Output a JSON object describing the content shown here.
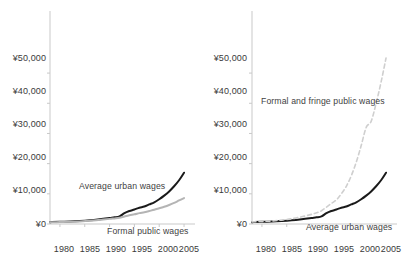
{
  "figure": {
    "background_color": "#ffffff",
    "panel_count": 2
  },
  "axis": {
    "axis_color": "#c9c9c9",
    "y_ticks": [
      "¥0",
      "¥10,000",
      "¥20,000",
      "¥30,000",
      "¥40,000",
      "¥50,000"
    ],
    "x_ticks": [
      "1980",
      "1985",
      "1990",
      "1995",
      "2000",
      "2005"
    ]
  },
  "labels": {
    "left_average_urban": "Average urban wages",
    "left_formal_public": "Formal public wages",
    "right_formal_fringe": "Formal and fringe public wages",
    "right_average_urban": "Average urban wages"
  },
  "colors": {
    "average_urban_wages": "#1a1a1a",
    "formal_public_wages": "#b4b4b4",
    "formal_and_fringe_public_wages": "#cfcfcf",
    "axis": "#c9c9c9",
    "text": "#3a3a3a"
  },
  "chart_data": [
    {
      "type": "line",
      "panel": "left",
      "title": "",
      "xlabel": "",
      "ylabel": "",
      "xlim": [
        1978,
        2006
      ],
      "ylim": [
        0,
        55000
      ],
      "ytick_values": [
        0,
        10000,
        20000,
        30000,
        40000,
        50000
      ],
      "ytick_labels": [
        "¥0",
        "¥10,000",
        "¥20,000",
        "¥30,000",
        "¥40,000",
        "¥50,000"
      ],
      "xtick_values": [
        1980,
        1985,
        1990,
        1995,
        2000,
        2005
      ],
      "xtick_labels": [
        "1980",
        "1985",
        "1990",
        "1995",
        "2000",
        "2005"
      ],
      "grid": false,
      "legend": "inline-annotations",
      "x": [
        1978,
        1980,
        1982,
        1984,
        1986,
        1988,
        1990,
        1991,
        1992,
        1993,
        1994,
        1995,
        1996,
        1997,
        1998,
        1999,
        2000,
        2001,
        2002,
        2003,
        2004,
        2005
      ],
      "series": [
        {
          "name": "Average urban wages",
          "style": "solid",
          "color": "#1a1a1a",
          "values": [
            620,
            760,
            820,
            1000,
            1250,
            1600,
            2000,
            2200,
            2500,
            3600,
            4300,
            4800,
            5400,
            5800,
            6500,
            7200,
            8200,
            9400,
            10800,
            12500,
            14500,
            17000
          ]
        },
        {
          "name": "Formal public wages",
          "style": "solid",
          "color": "#b4b4b4",
          "values": [
            560,
            640,
            720,
            860,
            1050,
            1350,
            1700,
            1850,
            2050,
            2500,
            2900,
            3200,
            3600,
            3900,
            4300,
            4700,
            5200,
            5700,
            6300,
            7000,
            7800,
            8600
          ]
        }
      ]
    },
    {
      "type": "line",
      "panel": "right",
      "title": "",
      "xlabel": "",
      "ylabel": "",
      "xlim": [
        1978,
        2006
      ],
      "ylim": [
        0,
        55000
      ],
      "ytick_values": [
        0,
        10000,
        20000,
        30000,
        40000,
        50000
      ],
      "ytick_labels": [
        "¥0",
        "¥10,000",
        "¥20,000",
        "¥30,000",
        "¥40,000",
        "¥50,000"
      ],
      "xtick_values": [
        1980,
        1985,
        1990,
        1995,
        2000,
        2005
      ],
      "xtick_labels": [
        "1980",
        "1985",
        "1990",
        "1995",
        "2000",
        "2005"
      ],
      "grid": false,
      "legend": "inline-annotations",
      "x": [
        1978,
        1980,
        1982,
        1984,
        1986,
        1988,
        1990,
        1991,
        1992,
        1993,
        1994,
        1995,
        1996,
        1997,
        1998,
        1999,
        2000,
        2001,
        2002,
        2003,
        2004,
        2005
      ],
      "series": [
        {
          "name": "Average urban wages",
          "style": "solid",
          "color": "#1a1a1a",
          "values": [
            620,
            760,
            820,
            1000,
            1250,
            1600,
            2000,
            2200,
            2500,
            3600,
            4300,
            4800,
            5400,
            5800,
            6500,
            7200,
            8200,
            9400,
            10800,
            12500,
            14500,
            17000
          ]
        },
        {
          "name": "Formal and fringe public wages",
          "style": "dashed",
          "color": "#cfcfcf",
          "values": [
            700,
            850,
            1000,
            1300,
            1750,
            2400,
            3200,
            3700,
            4400,
            5600,
            6800,
            8000,
            10000,
            12500,
            16000,
            20500,
            26000,
            32000,
            34000,
            40000,
            47000,
            55000
          ]
        }
      ]
    }
  ]
}
